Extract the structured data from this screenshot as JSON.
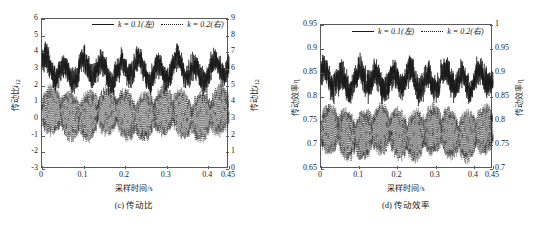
{
  "figure": {
    "background": "#ffffff",
    "line_color": "#1a1a1a",
    "axis_color": "#5a5a5a"
  },
  "legend": {
    "series": [
      {
        "key": "solid",
        "label": "k = 0.1(左)",
        "style": "solid"
      },
      {
        "key": "dotted",
        "label": "k = 0.2(右)",
        "style": "dotted"
      }
    ]
  },
  "panels": [
    {
      "id": "c",
      "caption": "(c) 传动比",
      "xlabel": "采样时间/s",
      "ylabel_left": "传动比i12",
      "ylabel_right": "传动比i12",
      "xticks": [
        "0",
        "0.1",
        "0.2",
        "0.3",
        "0.4",
        "0.45"
      ],
      "yticks_left": [
        "-3",
        "-2",
        "-1",
        "0",
        "1",
        "2",
        "3",
        "4",
        "5",
        "6"
      ],
      "yticks_right": [
        "0",
        "1",
        "2",
        "3",
        "4",
        "5",
        "6",
        "7",
        "8",
        "9"
      ]
    },
    {
      "id": "d",
      "caption": "(d) 传动效率",
      "xlabel": "采样时间/s",
      "ylabel_left": "传动效率η",
      "ylabel_right": "传动效率η",
      "xticks": [
        "0",
        "0.1",
        "0.2",
        "0.3",
        "0.4",
        "0.45"
      ],
      "yticks_left": [
        "0.65",
        "0.7",
        "0.75",
        "0.8",
        "0.85",
        "0.9",
        "0.95"
      ],
      "yticks_right": [
        "0.7",
        "0.75",
        "0.8",
        "0.85",
        "0.9",
        "0.95",
        "1"
      ]
    }
  ],
  "chart_data": [
    {
      "type": "line",
      "id": "c",
      "title": "(c) 传动比",
      "xlabel": "采样时间/s",
      "ylabel": "传动比i12",
      "ylabel_right": "传动比i12",
      "xlim": [
        0,
        0.45
      ],
      "ylim": [
        -3,
        6
      ],
      "ylim_right": [
        0,
        9
      ],
      "grid": false,
      "legend_position": "top-center",
      "xticks": [
        0,
        0.1,
        0.2,
        0.3,
        0.4,
        0.45
      ],
      "yticks": [
        -3,
        -2,
        -1,
        0,
        1,
        2,
        3,
        4,
        5,
        6
      ],
      "yticks_right": [
        0,
        1,
        2,
        3,
        4,
        5,
        6,
        7,
        8,
        9
      ],
      "series": [
        {
          "name": "k = 0.1(左)",
          "axis": "left",
          "style": "solid",
          "description": "Dense noisy band oscillating about a slow ~0.045 s periodic envelope; mean ≈ 2.9, band spans roughly 1.9 to 4.5",
          "mean": 2.9,
          "band_min": 1.9,
          "band_max": 4.5,
          "envelope_period_s": 0.045,
          "envelope_amplitude": 0.55,
          "noise_amplitude": 0.75
        },
        {
          "name": "k = 0.2(右)",
          "axis": "right",
          "style": "dotted",
          "description": "High-frequency burst oscillation on the right scale; mean ≈ 3.3 (right axis), bursts span about 1.6 to 4.4",
          "mean_right": 3.3,
          "band_min_right": 1.6,
          "band_max_right": 4.4,
          "burst_period_s": 0.045,
          "carrier_freq_hz": 420,
          "noise_amplitude_right": 0.35
        }
      ]
    },
    {
      "type": "line",
      "id": "d",
      "title": "(d) 传动效率",
      "xlabel": "采样时间/s",
      "ylabel": "传动效率η",
      "ylabel_right": "传动效率η",
      "xlim": [
        0,
        0.45
      ],
      "ylim": [
        0.65,
        0.95
      ],
      "ylim_right": [
        0.7,
        1.0
      ],
      "grid": false,
      "legend_position": "top-center",
      "xticks": [
        0,
        0.1,
        0.2,
        0.3,
        0.4,
        0.45
      ],
      "yticks": [
        0.65,
        0.7,
        0.75,
        0.8,
        0.85,
        0.9,
        0.95
      ],
      "yticks_right": [
        0.7,
        0.75,
        0.8,
        0.85,
        0.9,
        0.95,
        1.0
      ],
      "series": [
        {
          "name": "k = 0.1(左)",
          "axis": "left",
          "style": "solid",
          "description": "Dense noisy band with slow ~0.045 s envelope; mean ≈ 0.835, band spans about 0.80 to 0.885",
          "mean": 0.835,
          "band_min": 0.8,
          "band_max": 0.885,
          "envelope_period_s": 0.045,
          "envelope_amplitude": 0.018,
          "noise_amplitude": 0.028
        },
        {
          "name": "k = 0.2(右)",
          "axis": "right",
          "style": "dotted",
          "description": "High-frequency burst oscillation; on the left-scale reading it spans about 0.695 to 0.79 with mean ≈ 0.725",
          "mean_right": 0.775,
          "band_min_right": 0.745,
          "band_max_right": 0.84,
          "burst_period_s": 0.045,
          "carrier_freq_hz": 420,
          "noise_amplitude_right": 0.012
        }
      ]
    }
  ]
}
